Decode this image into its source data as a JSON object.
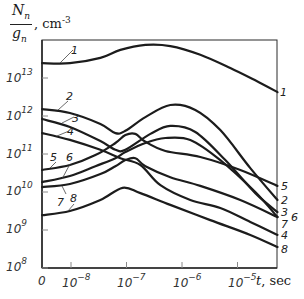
{
  "chart_data": {
    "type": "line",
    "title": "",
    "ylabel": "N_n / g_n, cm^-3",
    "ylabel_numerator": "N",
    "ylabel_numerator_sub": "n",
    "ylabel_denominator": "g",
    "ylabel_denominator_sub": "n",
    "ylabel_units": ", cm",
    "ylabel_units_exp": "-3",
    "xlabel": "t, sec",
    "xlabel_var": "t",
    "xlabel_units": ", sec",
    "xscale": "log (with origin 0)",
    "yscale": "log",
    "ylim_log10": [
      8,
      14
    ],
    "xlim_log10": [
      -8.5,
      -4.3
    ],
    "grid": false,
    "legend": "curve numbers labeled inline",
    "y_ticks": [
      {
        "base": "10",
        "exp": "8",
        "log": 8
      },
      {
        "base": "10",
        "exp": "9",
        "log": 9
      },
      {
        "base": "10",
        "exp": "10",
        "log": 10
      },
      {
        "base": "10",
        "exp": "11",
        "log": 11
      },
      {
        "base": "10",
        "exp": "12",
        "log": 12
      },
      {
        "base": "10",
        "exp": "13",
        "log": 13
      }
    ],
    "x_ticks": [
      {
        "base": "0",
        "exp": "",
        "log": null
      },
      {
        "base": "10",
        "exp": "−8",
        "log": -8
      },
      {
        "base": "10",
        "exp": "−7",
        "log": -7
      },
      {
        "base": "10",
        "exp": "−6",
        "log": -6
      },
      {
        "base": "10",
        "exp": "−5",
        "log": -5
      }
    ],
    "series_note": "x given as log10(t) (first point at t=0 origin drawn at log10=-8.52); y given as log10(N/g)",
    "series": [
      {
        "name": "1",
        "x": [
          -8.52,
          -8.02,
          -7.47,
          -7.11,
          -6.66,
          -6.21,
          -5.67,
          -5.13,
          -4.59,
          -4.28
        ],
        "y": [
          13.39,
          13.39,
          13.53,
          13.74,
          13.87,
          13.84,
          13.61,
          13.26,
          12.87,
          12.63
        ]
      },
      {
        "name": "2",
        "x": [
          -8.52,
          -8.02,
          -7.47,
          -7.2,
          -7.02,
          -6.66,
          -6.21,
          -5.76,
          -5.31,
          -4.77,
          -4.28
        ],
        "y": [
          12.18,
          12.08,
          11.79,
          11.55,
          11.61,
          11.97,
          12.29,
          12.16,
          11.63,
          10.63,
          9.79
        ]
      },
      {
        "name": "3",
        "x": [
          -8.52,
          -8.02,
          -7.47,
          -7.2,
          -7.02,
          -6.57,
          -6.21,
          -5.76,
          -5.22,
          -4.68,
          -4.28
        ],
        "y": [
          11.92,
          11.71,
          11.34,
          11.11,
          11.11,
          11.53,
          11.74,
          11.58,
          10.84,
          9.97,
          9.47
        ]
      },
      {
        "name": "4",
        "x": [
          -8.52,
          -8.02,
          -7.47,
          -7.11,
          -6.75,
          -6.39,
          -5.85,
          -5.31,
          -4.77,
          -4.28
        ],
        "y": [
          11.55,
          11.37,
          11.11,
          10.89,
          10.71,
          10.18,
          9.79,
          9.58,
          9.21,
          8.87
        ]
      },
      {
        "name": "5",
        "x": [
          -8.52,
          -8.02,
          -7.56,
          -7.2,
          -7.02,
          -6.84,
          -6.66,
          -6.3,
          -5.67,
          -4.95,
          -4.28
        ],
        "y": [
          10.58,
          10.71,
          10.97,
          11.29,
          11.5,
          11.53,
          11.32,
          11.08,
          10.92,
          10.58,
          10.16
        ]
      },
      {
        "name": "6",
        "x": [
          -8.52,
          -8.02,
          -7.56,
          -7.2,
          -7.02,
          -6.66,
          -6.3,
          -5.85,
          -5.31,
          -4.68,
          -4.28
        ],
        "y": [
          10.26,
          10.42,
          10.68,
          10.89,
          11.05,
          11.29,
          11.42,
          11.37,
          10.84,
          10.0,
          9.34
        ]
      },
      {
        "name": "7",
        "x": [
          -8.52,
          -8.02,
          -7.47,
          -7.2,
          -7.02,
          -6.84,
          -6.66,
          -6.21,
          -5.67,
          -4.95,
          -4.28
        ],
        "y": [
          10.13,
          10.21,
          10.47,
          10.68,
          10.84,
          10.89,
          10.68,
          10.39,
          10.16,
          9.79,
          9.34
        ]
      },
      {
        "name": "8",
        "x": [
          -8.52,
          -8.02,
          -7.47,
          -7.07,
          -6.75,
          -6.21,
          -5.49,
          -4.77,
          -4.28
        ],
        "y": [
          9.39,
          9.5,
          9.79,
          10.11,
          9.97,
          9.66,
          9.26,
          8.87,
          8.55
        ]
      }
    ]
  },
  "layout_px": {
    "origin_x": 42,
    "x_decade_px": 55.5,
    "x_ref_log": -8,
    "x_ref_px": 71,
    "y_base_log": 8,
    "y_base_px": 268,
    "y_decade_px": 38,
    "plot_left": 42,
    "plot_right": 277,
    "plot_top": 40,
    "plot_bottom": 268
  },
  "curve_labels": [
    {
      "text": "1",
      "x": 71,
      "y": 44,
      "lx1": 60,
      "ly1": 63,
      "lx2": 73,
      "ly2": 50
    },
    {
      "text": "1",
      "x": 280,
      "y": 86
    },
    {
      "text": "2",
      "x": 66,
      "y": 90,
      "lx1": 58,
      "ly1": 110,
      "lx2": 68,
      "ly2": 101
    },
    {
      "text": "3",
      "x": 72,
      "y": 112,
      "lx1": 62,
      "ly1": 123,
      "lx2": 74,
      "ly2": 117
    },
    {
      "text": "4",
      "x": 67,
      "y": 125,
      "lx1": 57,
      "ly1": 136,
      "lx2": 69,
      "ly2": 131
    },
    {
      "text": "5",
      "x": 50,
      "y": 151,
      "lx1": 50,
      "ly1": 168,
      "lx2": 56,
      "ly2": 162
    },
    {
      "text": "6",
      "x": 66,
      "y": 151,
      "lx1": 62,
      "ly1": 179,
      "lx2": 70,
      "ly2": 164
    },
    {
      "text": "7",
      "x": 57,
      "y": 196,
      "lx1": 62,
      "ly1": 186,
      "lx2": 66,
      "ly2": 194
    },
    {
      "text": "8",
      "x": 70,
      "y": 192,
      "lx1": 68,
      "ly1": 211,
      "lx2": 74,
      "ly2": 204
    },
    {
      "text": "5",
      "x": 281,
      "y": 180
    },
    {
      "text": "2",
      "x": 281,
      "y": 194
    },
    {
      "text": "3",
      "x": 281,
      "y": 206
    },
    {
      "text": "6",
      "x": 291,
      "y": 211
    },
    {
      "text": "7",
      "x": 281,
      "y": 218
    },
    {
      "text": "4",
      "x": 281,
      "y": 229
    },
    {
      "text": "8",
      "x": 281,
      "y": 243
    }
  ],
  "colors": {
    "line": "#1c1c1c",
    "axis": "#2a2a2a",
    "tick": "#8a8a8a",
    "background": "#ffffff"
  }
}
